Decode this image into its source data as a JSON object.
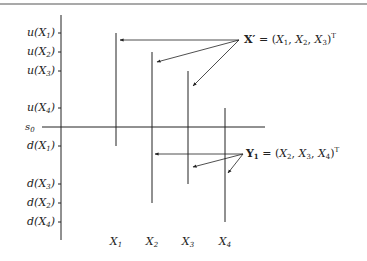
{
  "diagram": {
    "y_axis_labels": [
      {
        "id": "u1",
        "label": "u(X1)",
        "fn": "u",
        "var": "X",
        "sub": "1",
        "y": 33
      },
      {
        "id": "u2",
        "label": "u(X2)",
        "fn": "u",
        "var": "X",
        "sub": "2",
        "y": 52
      },
      {
        "id": "u3",
        "label": "u(X3)",
        "fn": "u",
        "var": "X",
        "sub": "3",
        "y": 71
      },
      {
        "id": "u4",
        "label": "u(X4)",
        "fn": "u",
        "var": "X",
        "sub": "4",
        "y": 108
      },
      {
        "id": "s0",
        "label": "s0",
        "fn": "s",
        "sub": "0",
        "y": 127
      },
      {
        "id": "d1",
        "label": "d(X1)",
        "fn": "d",
        "var": "X",
        "sub": "1",
        "y": 146
      },
      {
        "id": "d3",
        "label": "d(X3)",
        "fn": "d",
        "var": "X",
        "sub": "3",
        "y": 184
      },
      {
        "id": "d2",
        "label": "d(X2)",
        "fn": "d",
        "var": "X",
        "sub": "2",
        "y": 203
      },
      {
        "id": "d4",
        "label": "d(X4)",
        "fn": "d",
        "var": "X",
        "sub": "4",
        "y": 222
      }
    ],
    "x_axis_labels": [
      {
        "label": "X1",
        "var": "X",
        "sub": "1",
        "x": 116
      },
      {
        "label": "X2",
        "var": "X",
        "sub": "2",
        "x": 152
      },
      {
        "label": "X3",
        "var": "X",
        "sub": "3",
        "x": 188
      },
      {
        "label": "X4",
        "var": "X",
        "sub": "4",
        "x": 225
      }
    ],
    "intervals": [
      {
        "name": "X1",
        "x": 116,
        "upper": "u(X1)",
        "lower": "d(X1)",
        "y_top": 33,
        "y_bottom": 146
      },
      {
        "name": "X2",
        "x": 152,
        "upper": "u(X2)",
        "lower": "d(X2)",
        "y_top": 52,
        "y_bottom": 203
      },
      {
        "name": "X3",
        "x": 188,
        "upper": "u(X3)",
        "lower": "d(X3)",
        "y_top": 71,
        "y_bottom": 184
      },
      {
        "name": "X4",
        "x": 225,
        "upper": "u(X4)",
        "lower": "d(X4)",
        "y_top": 108,
        "y_bottom": 222
      }
    ],
    "annotations": [
      {
        "id": "x-prime",
        "bold_symbol": "X′",
        "equals": "=",
        "tuple": [
          "X1",
          "X2",
          "X3"
        ],
        "text": "X′ = (X1, X2, X3)T",
        "superscript": "T",
        "points_to": [
          "X1",
          "X2",
          "X3"
        ]
      },
      {
        "id": "y-one",
        "bold_symbol": "Y1",
        "equals": "=",
        "tuple": [
          "X2",
          "X3",
          "X4"
        ],
        "text": "Y1 = (X2, X3, X4)T",
        "superscript": "T",
        "points_to": [
          "X2",
          "X3",
          "X4"
        ]
      }
    ],
    "colors": {
      "line": "#222222",
      "background": "#ffffff"
    }
  }
}
